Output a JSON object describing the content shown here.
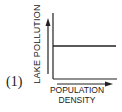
{
  "figure": {
    "panel_label": "(1)",
    "ylabel": "LAKE POLLUTION",
    "xlabel_line1": "POPULATION",
    "xlabel_line2": "DENSITY",
    "line_color": "#222222",
    "background": "#ffffff"
  },
  "chart_data": {
    "type": "line",
    "title": "",
    "panel_label": "(1)",
    "xlabel": "POPULATION DENSITY",
    "ylabel": "LAKE POLLUTION",
    "x": [
      0,
      1
    ],
    "series": [
      {
        "name": "Lake pollution vs population density",
        "values": [
          0.5,
          0.5
        ]
      }
    ],
    "relationship": "constant (no change in lake pollution as population density increases)",
    "xlim": [
      0,
      1
    ],
    "ylim": [
      0,
      1
    ],
    "grid": false,
    "legend": null,
    "ticks": "none",
    "axis_arrows": {
      "x": "increasing to the right",
      "y": "increasing upward"
    }
  }
}
